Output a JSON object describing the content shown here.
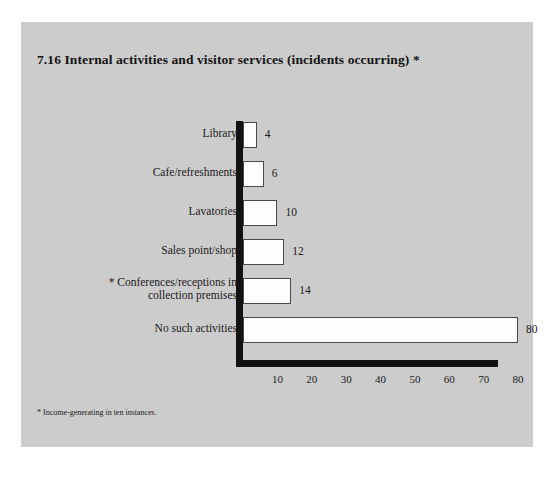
{
  "figure": {
    "title": "7.16  Internal activities and visitor services (incidents occurring) *",
    "footnote": "* Income-generating in ten instances.",
    "panel_color": "#cccccc",
    "bar_fill_color": "#fdfdfd",
    "bar_edge_color": "#4a4a4a",
    "axis_color": "#121212"
  },
  "chart_data": {
    "type": "bar",
    "orientation": "horizontal",
    "title": "7.16  Internal activities and visitor services (incidents occurring) *",
    "xlabel": "",
    "ylabel": "",
    "xlim": [
      0,
      80
    ],
    "xticks": [
      10,
      20,
      30,
      40,
      50,
      60,
      70,
      80
    ],
    "grid": false,
    "legend": false,
    "categories": [
      "Library",
      "Cafe/refreshments",
      "Lavatories",
      "Sales point/shop",
      "* Conferences/receptions in collection premises",
      "No such activities"
    ],
    "category_lines": [
      [
        "Library"
      ],
      [
        "Cafe/refreshments"
      ],
      [
        "Lavatories"
      ],
      [
        "Sales point/shop"
      ],
      [
        "* Conferences/receptions in",
        "collection premises"
      ],
      [
        "No such activities"
      ]
    ],
    "values": [
      4,
      6,
      10,
      12,
      14,
      80
    ],
    "value_labels": [
      "4",
      "6",
      "10",
      "12",
      "14",
      "80"
    ]
  }
}
